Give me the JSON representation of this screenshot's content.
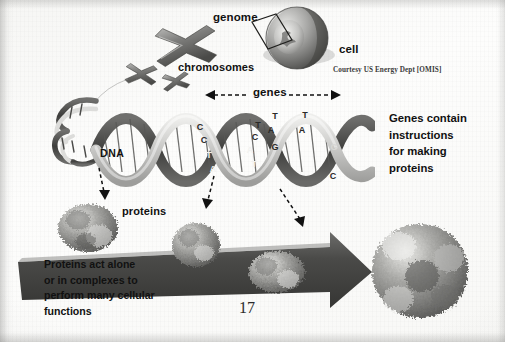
{
  "page": {
    "number": "17",
    "credit": "Courtesy US Energy Dept [OMIS]",
    "background_color": "#fbfbfa",
    "ink_color": "#111111"
  },
  "labels": {
    "genome": "genome",
    "cell": "cell",
    "chromosomes": "chromosomes",
    "genes": "genes",
    "dna": "DNA",
    "proteins": "proteins"
  },
  "notes": {
    "genes_instructions": {
      "lines": [
        "Genes contain",
        "instructions",
        "for making",
        "proteins"
      ]
    },
    "proteins_function": {
      "lines": [
        "Proteins act alone",
        "or in complexes to",
        "perform many cellular",
        "functions"
      ]
    }
  },
  "dna_bases": {
    "left_strand": [
      "C",
      "C",
      "T",
      "A"
    ],
    "middle_strand": [
      "T",
      "C",
      "A",
      "T",
      "G"
    ],
    "right_strand": [
      "T",
      "A",
      "T",
      "A",
      "G",
      "C"
    ]
  },
  "diagram": {
    "type": "biology-flow",
    "flow": [
      "cell",
      "genome",
      "chromosomes",
      "genes",
      "DNA",
      "proteins"
    ],
    "element_count": {
      "chromosomes": 3,
      "protein_blobs": 4
    },
    "colors": {
      "arrow_fill": "#4a4a4a",
      "helix_dark": "#5c5c5c",
      "helix_light": "#d8d8d6",
      "protein_mid": "#8f8f8d"
    }
  }
}
